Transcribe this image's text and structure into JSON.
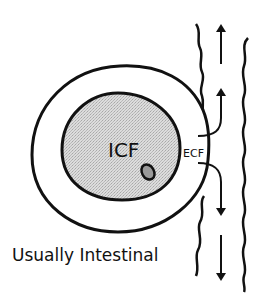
{
  "diagram": {
    "labels": {
      "inner": "ICF",
      "outer": "ECF",
      "caption": "Usually Intestinal"
    },
    "colors": {
      "stroke": "#111111",
      "inner_fill": "#d4d4d4",
      "nucleus_fill": "#9a9a9a",
      "background": "#ffffff"
    },
    "arrows": [
      {
        "direction": "up",
        "from": "ECF",
        "path": "curved"
      },
      {
        "direction": "up",
        "path": "straight"
      },
      {
        "direction": "down",
        "from": "ECF",
        "path": "curved"
      },
      {
        "direction": "down",
        "path": "straight"
      }
    ]
  }
}
